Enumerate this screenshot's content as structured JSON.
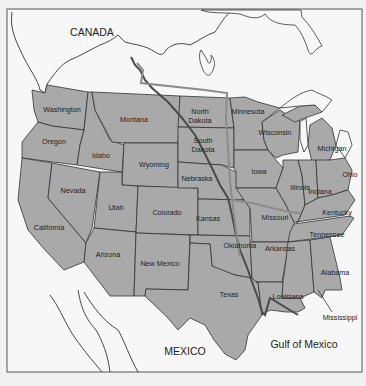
{
  "map": {
    "colors": {
      "background": "#f1f1f1",
      "land_foreign": "#f7f7f7",
      "us_states": "#a9a9a9",
      "borders": "#333333",
      "pipeline_primary": "#4a4a4a",
      "pipeline_secondary": "#8c8c8c"
    },
    "regions": {
      "canada": "CANADA",
      "mexico": "MEXICO",
      "gulf": "Gulf of Mexico"
    },
    "states": {
      "washington": "Washington",
      "oregon": "Oregon",
      "california": "California",
      "nevada": "Nevada",
      "idaho": "Idaho",
      "montana": "Montana",
      "wyoming": "Wyoming",
      "utah": "Utah",
      "arizona": "Arizona",
      "colorado": "Colorado",
      "new_mexico": "New Mexico",
      "north_dakota_1": "North",
      "north_dakota_2": "Dakota",
      "south_dakota_1": "South",
      "south_dakota_2": "Dakota",
      "nebraska": "Nebraska",
      "kansas": "Kansas",
      "oklahoma": "Oklahoma",
      "texas": "Texas",
      "minnesota": "Minnesota",
      "iowa": "Iowa",
      "missouri": "Missouri",
      "arkansas": "Arkansas",
      "louisiana": "Louisiana",
      "wisconsin": "Wisconsin",
      "illinois": "Illinois",
      "michigan": "Michigan",
      "indiana": "Indiana",
      "ohio": "Ohio",
      "kentucky": "Kentucky",
      "tennessee": "Tennessee",
      "mississippi": "Mississippi",
      "alabama": "Alabama"
    },
    "routes": [
      {
        "name": "primary-pipeline",
        "color": "#4a4a4a"
      },
      {
        "name": "secondary-pipeline",
        "color": "#8c8c8c"
      }
    ]
  }
}
